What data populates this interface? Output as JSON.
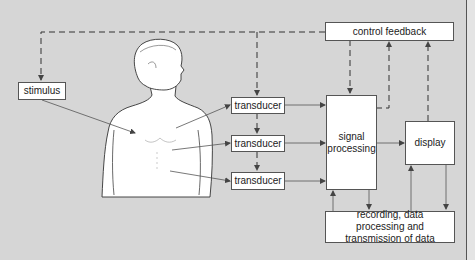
{
  "diagram": {
    "boxes": {
      "stimulus": "stimulus",
      "transducer_1": "transducer",
      "transducer_2": "transducer",
      "transducer_3": "transducer",
      "signal_processing": "signal processing",
      "display": "display",
      "control_feedback": "control feedback",
      "recording": "recording, data processing and transmission of data"
    },
    "illustration": "human-torso-figure",
    "colors": {
      "background": "#d6d6d6",
      "box_fill": "#ffffff",
      "line": "#555555"
    }
  }
}
